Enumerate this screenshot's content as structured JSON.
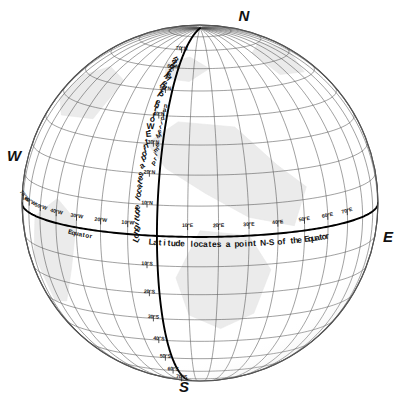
{
  "figure": {
    "type": "globe-graticule-diagram",
    "background_color": "#ffffff",
    "sphere": {
      "center_x": 200,
      "center_y": 203,
      "radius": 178,
      "outline_color": "#555555",
      "fill_color": "#ffffff",
      "land_shade_color": "#e8e8e8"
    },
    "graticule": {
      "grid_color": "#4a4a4a",
      "grid_spacing_degrees": 10,
      "axis_color": "#000000",
      "tilt_degrees": 11,
      "rotation_degrees": -14
    }
  },
  "cardinals": [
    {
      "label": "N",
      "name": "north-pole-label",
      "x": 244,
      "y": 21
    },
    {
      "label": "S",
      "name": "south-pole-label",
      "x": 184,
      "y": 392
    },
    {
      "label": "W",
      "name": "west-label",
      "x": 14,
      "y": 161
    },
    {
      "label": "E",
      "name": "east-label",
      "x": 388,
      "y": 242
    }
  ],
  "annotations": {
    "longitude_text": "Longitude locates a point E-W of the Prime Meridian",
    "latitude_text": "Latitude locates a point N-S of the Equator",
    "equator_label": "Equator",
    "prime_meridian_label": "Prime Meridian"
  },
  "chart_data": {
    "type": "map",
    "projection": "orthographic",
    "grid_interval_degrees": 10,
    "reference_lines": [
      {
        "name": "Equator",
        "latitude": 0,
        "emphasis": "heavy"
      },
      {
        "name": "Prime Meridian",
        "longitude": 0,
        "emphasis": "heavy"
      }
    ],
    "latitude_ticks_north": [
      "10°N",
      "20°N",
      "30°N",
      "40°N",
      "50°N",
      "60°N",
      "70°N"
    ],
    "latitude_ticks_south": [
      "10°S",
      "20°S",
      "30°S",
      "40°S",
      "50°S",
      "60°S",
      "70°S"
    ],
    "longitude_ticks_west": [
      "10°W",
      "20°W",
      "30°W",
      "40°W",
      "50°W",
      "60°W",
      "70°W"
    ],
    "longitude_ticks_east": [
      "10°E",
      "20°E",
      "30°E",
      "40°E",
      "50°E",
      "60°E",
      "70°E"
    ],
    "latitude_values_north": [
      10,
      20,
      30,
      40,
      50,
      60,
      70
    ],
    "latitude_values_south": [
      -10,
      -20,
      -30,
      -40,
      -50,
      -60,
      -70
    ],
    "longitude_values_west": [
      -10,
      -20,
      -30,
      -40,
      -50,
      -60,
      -70
    ],
    "longitude_values_east": [
      10,
      20,
      30,
      40,
      50,
      60,
      70
    ],
    "cardinal_points": [
      "N",
      "E",
      "S",
      "W"
    ],
    "annotations": [
      "Longitude locates a point E-W of the Prime Meridian",
      "Latitude locates a point N-S of the Equator",
      "Equator",
      "Prime Meridian"
    ],
    "xlabel": "Longitude",
    "ylabel": "Latitude",
    "xlim": [
      -90,
      90
    ],
    "ylim": [
      -90,
      90
    ],
    "grid": true,
    "legend": "none"
  }
}
